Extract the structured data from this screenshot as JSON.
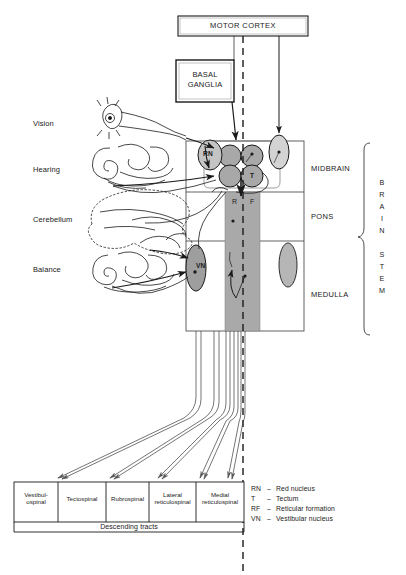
{
  "diagram": {
    "title_boxes": {
      "motor_cortex": "MOTOR CORTEX",
      "basal_ganglia_line1": "BASAL",
      "basal_ganglia_line2": "GANGLIA"
    },
    "input_labels": [
      {
        "id": "vision",
        "label": "Vision"
      },
      {
        "id": "hearing",
        "label": "Hearing"
      },
      {
        "id": "cerebellum",
        "label": "Cerebellum"
      },
      {
        "id": "balance",
        "label": "Balance"
      }
    ],
    "brainstem_regions": [
      {
        "id": "midbrain",
        "label": "MIDBRAIN"
      },
      {
        "id": "pons",
        "label": "PONS"
      },
      {
        "id": "medulla",
        "label": "MEDULLA"
      }
    ],
    "brainstem_bracket": {
      "word1": "BRAIN",
      "word2": "STEM",
      "letters1": [
        "B",
        "R",
        "A",
        "I",
        "N"
      ],
      "letters2": [
        "S",
        "T",
        "E",
        "M"
      ]
    },
    "nuclei": [
      {
        "id": "red-nucleus",
        "abbr": "RN"
      },
      {
        "id": "tectum",
        "abbr": "T"
      },
      {
        "id": "vestibular-nucleus",
        "abbr": "VN"
      }
    ],
    "reticular_formation": {
      "letter_left": "R",
      "letter_right": "F"
    },
    "descending_tracts": {
      "caption": "Descending tracts",
      "tracts": [
        {
          "id": "vestibulospinal",
          "line1": "Vestibul-",
          "line2": "ospinal"
        },
        {
          "id": "tectospinal",
          "line1": "Tectospinal",
          "line2": ""
        },
        {
          "id": "rubrospinal",
          "line1": "Rubrospinal",
          "line2": ""
        },
        {
          "id": "lateral-reticulospinal",
          "line1": "Lateral",
          "line2": "reticulospinal"
        },
        {
          "id": "medial-reticulospinal",
          "line1": "Medial",
          "line2": "reticulospinal"
        }
      ]
    },
    "legend": [
      {
        "abbr": "RN",
        "dash": "–",
        "term": "Red nucleus"
      },
      {
        "abbr": "T",
        "dash": "–",
        "term": "Tectum"
      },
      {
        "abbr": "RF",
        "dash": "–",
        "term": "Reticular formation"
      },
      {
        "abbr": "VN",
        "dash": "–",
        "term": "Vestibular nucleus"
      }
    ],
    "colors": {
      "stroke": "#1a1a1a",
      "nucleus_fill": "#b3b3b3",
      "colliculus_fill": "#a8a8a8",
      "reticular_fill": "#a9a9a9",
      "light_fill": "#cfcfcf",
      "background": "#ffffff"
    }
  }
}
